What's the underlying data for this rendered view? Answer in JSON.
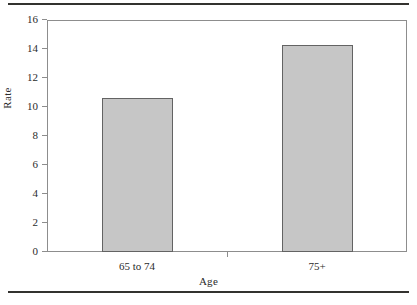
{
  "chart_data": {
    "type": "bar",
    "title": "",
    "subtitle": "",
    "xlabel": "Age",
    "ylabel": "Rate",
    "categories": [
      "65 to 74",
      "75+"
    ],
    "values": [
      10.6,
      14.3
    ],
    "series": [
      {
        "name": "Rate",
        "values": [
          10.6,
          14.3
        ]
      }
    ],
    "ylim": [
      0,
      16
    ],
    "yticks": [
      0,
      2,
      4,
      6,
      8,
      10,
      12,
      14,
      16
    ],
    "ytick_labels": [
      "0",
      "2",
      "4",
      "6",
      "8",
      "10",
      "12",
      "14",
      "16"
    ],
    "xtick_labels": [
      "65 to 74",
      "75+"
    ],
    "grid": false,
    "legend": null,
    "annotations": [],
    "colors": {
      "bar_fill": "#c6c6c6",
      "bar_border": "#636363",
      "axis": "#8d8d8d",
      "text": "#2b2b2b",
      "rule": "#33322f",
      "background": "#ffffff"
    }
  },
  "figure": {
    "top_rule": "",
    "bottom_rule": ""
  }
}
